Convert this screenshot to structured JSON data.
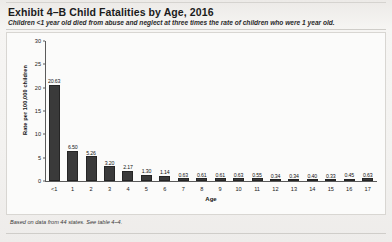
{
  "exhibit": {
    "title": "Exhibit 4–B Child Fatalities by Age, 2016",
    "subtitle": "Children <1 year old died from abuse and neglect at three times the rate of children who were 1 year old.",
    "footnote": "Based on data from 44 states. See table 4–4."
  },
  "chart_data": {
    "type": "bar",
    "title": "Exhibit 4–B Child Fatalities by Age, 2016",
    "subtitle": "Children <1 year old died from abuse and neglect at three times the rate of children who were 1 year old.",
    "xlabel": "Age",
    "ylabel": "Rate per 100,000 children",
    "categories": [
      "<1",
      "1",
      "2",
      "3",
      "4",
      "5",
      "6",
      "7",
      "8",
      "9",
      "10",
      "11",
      "12",
      "13",
      "14",
      "15",
      "16",
      "17"
    ],
    "values": [
      20.63,
      6.5,
      5.26,
      3.2,
      2.17,
      1.3,
      1.14,
      0.63,
      0.61,
      0.61,
      0.63,
      0.55,
      0.34,
      0.34,
      0.4,
      0.33,
      0.45,
      0.63
    ],
    "value_labels": [
      "20.63",
      "6.50",
      "5.26",
      "3.20",
      "2.17",
      "1.30",
      "1.14",
      "0.63",
      "0.61",
      "0.61",
      "0.63",
      "0.55",
      "0.34",
      "0.34",
      "0.40",
      "0.33",
      "0.45",
      "0.63"
    ],
    "ylim": [
      0,
      30
    ],
    "yticks": [
      0,
      5,
      10,
      15,
      20,
      25,
      30
    ],
    "ytick_labels": [
      "0",
      "5",
      "10",
      "15",
      "20",
      "25",
      "30"
    ],
    "grid": false,
    "legend": false,
    "bar_color": "#3a3a3a"
  },
  "colors": {
    "bar": "#3a3a3a",
    "axis": "#5b5b5b",
    "text": "#1b1b1b",
    "page": "#f2f1ef"
  }
}
